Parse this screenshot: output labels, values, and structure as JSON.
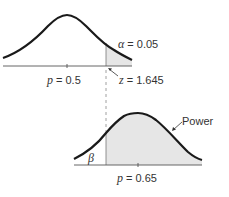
{
  "diagram": {
    "type": "hypothesis-test-power",
    "null_distribution": {
      "mean_label_var": "p",
      "mean_label_value": "= 0.5",
      "alpha_symbol": "α",
      "alpha_value": "= 0.05",
      "critical_var": "z",
      "critical_value": "= 1.645"
    },
    "alt_distribution": {
      "mean_label_var": "p",
      "mean_label_value": "= 0.65",
      "beta_symbol": "β",
      "power_label": "Power"
    },
    "colors": {
      "curve": "#1a1a1a",
      "shade": "#e6e6e6",
      "axis": "#555555",
      "dashed": "#888888"
    }
  }
}
